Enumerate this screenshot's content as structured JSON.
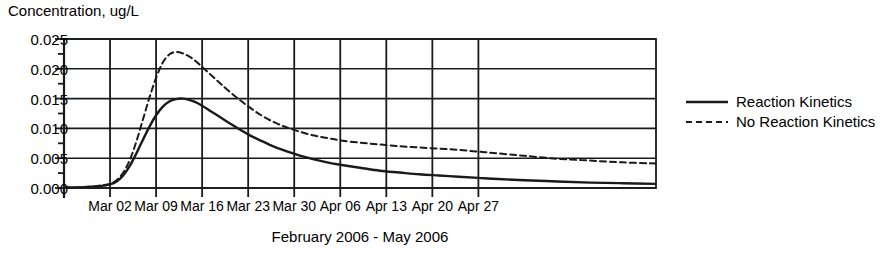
{
  "chart_data": {
    "type": "line",
    "title": "",
    "subtitle": "",
    "ylabel": "Concentration, ug/L",
    "xlabel": "February 2006 - May 2006",
    "ylim": [
      0.0,
      0.025
    ],
    "ytick_labels": [
      "0.025",
      "0.020",
      "0.015",
      "0.010",
      "0.005",
      "0.000"
    ],
    "ytick_values": [
      0.025,
      0.02,
      0.015,
      0.01,
      0.005,
      0.0
    ],
    "minor_yticks": [
      0.0225,
      0.0175,
      0.0125,
      0.0075,
      0.0025
    ],
    "xtick_labels": [
      "Mar 02",
      "Mar 09",
      "Mar 16",
      "Mar 23",
      "Mar 30",
      "Apr 06",
      "Apr 13",
      "Apr 20",
      "Apr 27"
    ],
    "xlim_days": [
      0,
      90
    ],
    "xtick_days": [
      7,
      14,
      21,
      28,
      35,
      42,
      49,
      56,
      63
    ],
    "grid": true,
    "grid_axes": "both",
    "legend_position": "right",
    "series": [
      {
        "name": "Reaction Kinetics",
        "style": "solid",
        "color": "#1a1a1a",
        "x": [
          0,
          2,
          4,
          5,
          6,
          7,
          8,
          9,
          10,
          11,
          12,
          13,
          14,
          15,
          16,
          17,
          18,
          19,
          20,
          21,
          22,
          23,
          24,
          26,
          28,
          30,
          32,
          34,
          36,
          38,
          40,
          42,
          45,
          48,
          51,
          54,
          57,
          60,
          63,
          66,
          70,
          75,
          80,
          85,
          90
        ],
        "y": [
          0.0001,
          0.0001,
          0.0002,
          0.0003,
          0.0004,
          0.0006,
          0.0011,
          0.0021,
          0.0037,
          0.0058,
          0.0081,
          0.0103,
          0.0122,
          0.0136,
          0.0145,
          0.0149,
          0.015,
          0.0148,
          0.0144,
          0.0138,
          0.0131,
          0.0124,
          0.0117,
          0.0103,
          0.009,
          0.0079,
          0.0069,
          0.0061,
          0.0054,
          0.0048,
          0.0043,
          0.0039,
          0.0034,
          0.0029,
          0.0026,
          0.0023,
          0.0021,
          0.0019,
          0.0017,
          0.0015,
          0.0013,
          0.0011,
          0.0009,
          0.0008,
          0.0007
        ]
      },
      {
        "name": "No Reaction Kinetics",
        "style": "dashed",
        "color": "#1a1a1a",
        "x": [
          0,
          2,
          4,
          5,
          6,
          7,
          8,
          9,
          10,
          11,
          12,
          13,
          14,
          15,
          16,
          17,
          18,
          19,
          20,
          21,
          22,
          23,
          24,
          26,
          28,
          30,
          32,
          34,
          36,
          38,
          40,
          42,
          45,
          48,
          51,
          54,
          57,
          60,
          63,
          66,
          70,
          75,
          80,
          85,
          90
        ],
        "y": [
          0.0001,
          0.0001,
          0.0002,
          0.0003,
          0.0005,
          0.0007,
          0.0013,
          0.0026,
          0.0047,
          0.0078,
          0.0115,
          0.0152,
          0.0185,
          0.021,
          0.0224,
          0.0228,
          0.0226,
          0.0221,
          0.0213,
          0.0203,
          0.0193,
          0.0183,
          0.0173,
          0.0154,
          0.0137,
          0.0122,
          0.011,
          0.0101,
          0.0094,
          0.0088,
          0.0084,
          0.008,
          0.0076,
          0.0073,
          0.007,
          0.0068,
          0.0066,
          0.0064,
          0.0061,
          0.0058,
          0.0054,
          0.0049,
          0.0046,
          0.0043,
          0.0041
        ]
      }
    ],
    "legend_entries": [
      "Reaction Kinetics",
      "No Reaction Kinetics"
    ]
  }
}
